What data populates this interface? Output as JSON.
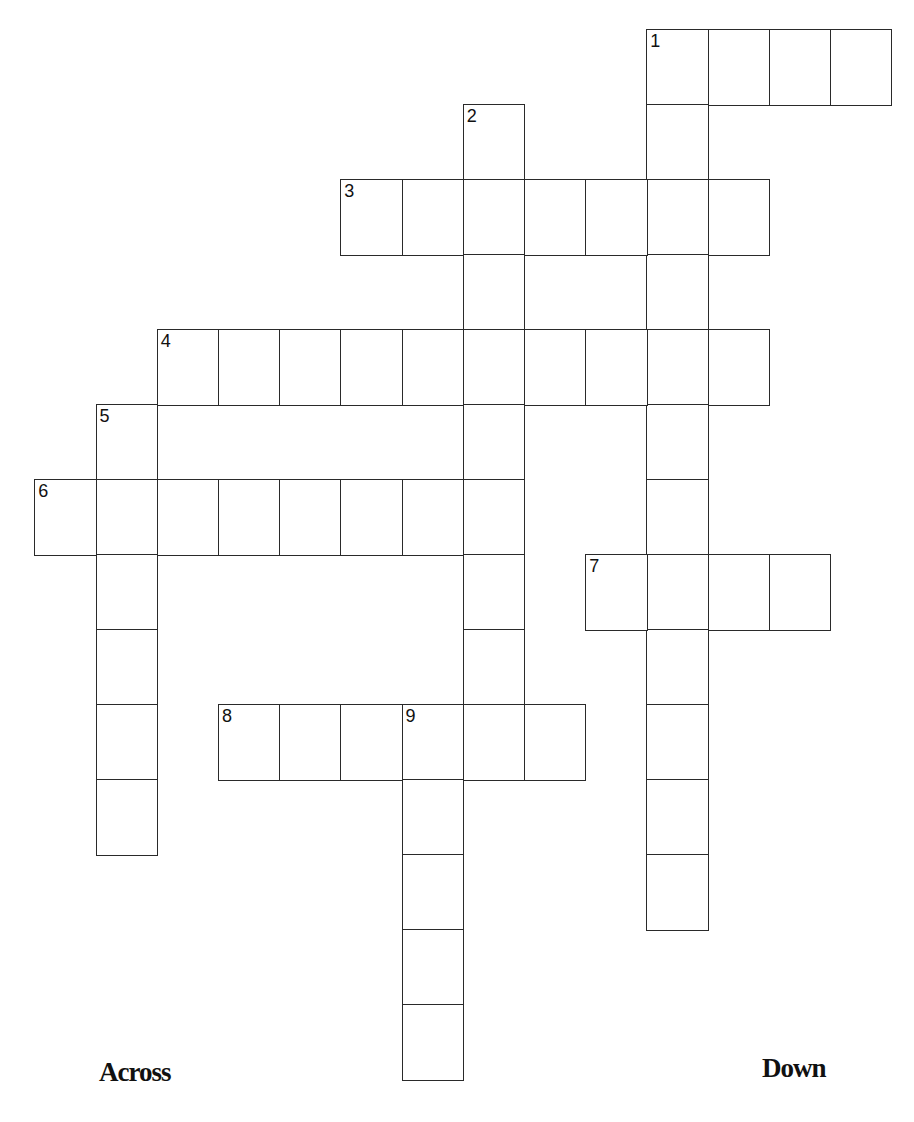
{
  "puzzle": {
    "grid": {
      "origin_x": 35,
      "origin_y": 30,
      "cell_width": 61.2,
      "cell_height": 75
    },
    "entries": [
      {
        "number": 1,
        "direction": "across",
        "row": 0,
        "col": 10,
        "length": 4
      },
      {
        "number": 1,
        "direction": "down",
        "row": 0,
        "col": 10,
        "length": 12
      },
      {
        "number": 2,
        "direction": "down",
        "row": 1,
        "col": 7,
        "length": 8
      },
      {
        "number": 3,
        "direction": "across",
        "row": 2,
        "col": 5,
        "length": 7
      },
      {
        "number": 4,
        "direction": "across",
        "row": 4,
        "col": 2,
        "length": 10
      },
      {
        "number": 5,
        "direction": "down",
        "row": 5,
        "col": 1,
        "length": 6
      },
      {
        "number": 6,
        "direction": "across",
        "row": 6,
        "col": 0,
        "length": 8
      },
      {
        "number": 7,
        "direction": "across",
        "row": 7,
        "col": 9,
        "length": 4
      },
      {
        "number": 8,
        "direction": "across",
        "row": 9,
        "col": 3,
        "length": 6
      },
      {
        "number": 9,
        "direction": "down",
        "row": 9,
        "col": 6,
        "length": 5
      }
    ]
  },
  "clues": {
    "across_heading": "Across",
    "down_heading": "Down"
  },
  "colors": {
    "line": "#2a2a2a",
    "text": "#111111",
    "background": "#ffffff"
  }
}
